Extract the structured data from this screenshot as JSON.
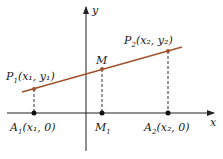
{
  "diagram": {
    "axes": {
      "x_label": "x",
      "y_label": "y"
    },
    "colors": {
      "segment": "#a0522d",
      "axis": "#222222"
    },
    "points": {
      "P1": {
        "name": "P",
        "sub": "1",
        "coords": "(x₁, y₁)"
      },
      "P2": {
        "name": "P",
        "sub": "2",
        "coords": "(x₂, y₂)"
      },
      "M": {
        "name": "M",
        "sub": "",
        "coords": ""
      },
      "A1": {
        "name": "A",
        "sub": "1",
        "coords": "(x₁, 0)"
      },
      "M1": {
        "name": "M",
        "sub": "1",
        "coords": ""
      },
      "A2": {
        "name": "A",
        "sub": "2",
        "coords": "(x₂, 0)"
      }
    }
  }
}
